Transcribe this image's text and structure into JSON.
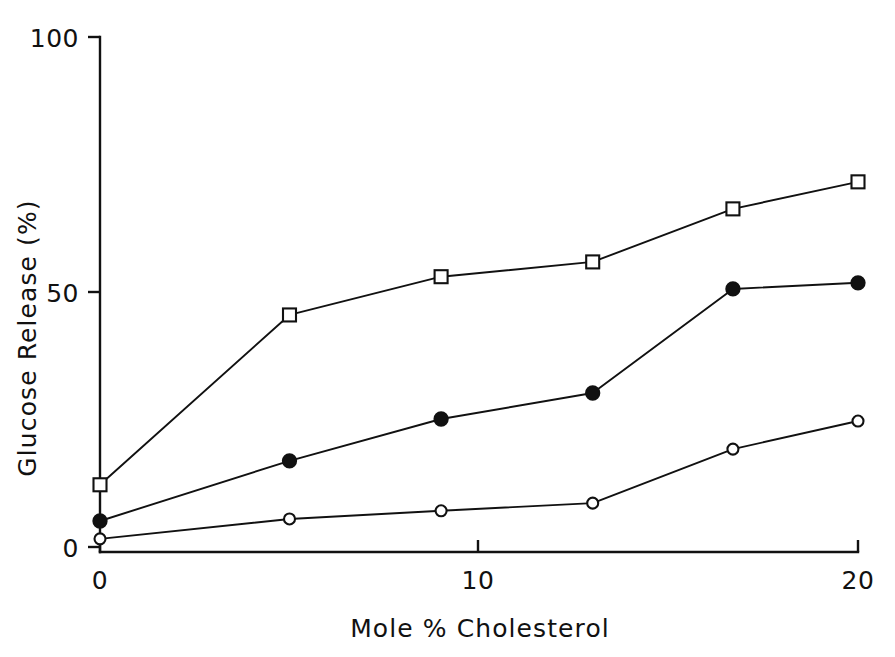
{
  "chart_data": {
    "type": "line",
    "title": "",
    "subtitle": "",
    "xlabel": "Mole % Cholesterol",
    "ylabel": "Glucose Release (%)",
    "xlim": [
      0,
      20
    ],
    "ylim": [
      0,
      100
    ],
    "xticks": [
      0,
      10,
      20
    ],
    "xtick_labels": [
      "0",
      "10",
      "20"
    ],
    "yticks": [
      0,
      50,
      100
    ],
    "ytick_labels": [
      "0",
      "50",
      "100"
    ],
    "grid": false,
    "legend_position": "none",
    "annotations": [],
    "series": [
      {
        "name": "open-square-series",
        "marker": "open-square",
        "x": [
          0,
          5,
          9,
          13,
          16.7,
          20
        ],
        "values": [
          12.2,
          45.5,
          53.0,
          55.9,
          66.3,
          71.6
        ]
      },
      {
        "name": "filled-circle-series",
        "marker": "filled-circle",
        "x": [
          0,
          5,
          9,
          13,
          16.7,
          20
        ],
        "values": [
          5.1,
          16.9,
          25.1,
          30.2,
          50.6,
          51.8
        ]
      },
      {
        "name": "open-circle-series",
        "marker": "open-circle",
        "x": [
          0,
          5,
          9,
          13,
          16.7,
          20
        ],
        "values": [
          1.6,
          5.5,
          7.1,
          8.6,
          19.2,
          24.7
        ]
      }
    ]
  },
  "figure": {
    "background_color": "#ffffff",
    "ink_color": "#111111"
  }
}
